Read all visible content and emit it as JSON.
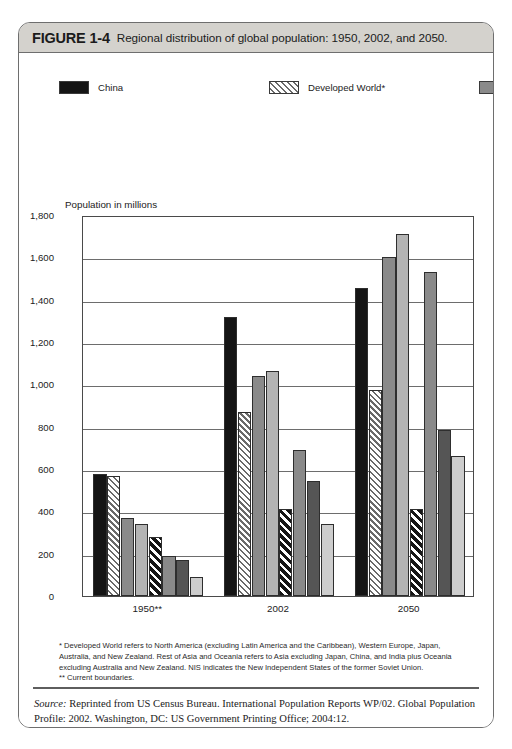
{
  "figure": {
    "label": "FIGURE 1-4",
    "title": "Regional distribution of global population: 1950, 2002, and 2050."
  },
  "legend": {
    "column_left": [
      {
        "label": "China",
        "swatch": "black-swatch",
        "fill": "#151515"
      },
      {
        "label": "Developed World*",
        "swatch": "white-diagonal-hatch-swatch",
        "fill": "#ffffff"
      },
      {
        "label": "India",
        "swatch": "medium-gray-swatch",
        "fill": "#8a8a8a"
      },
      {
        "label": "Rest of Asia and Oceania*",
        "swatch": "light-gray-swatch",
        "fill": "#b4b4b4"
      }
    ],
    "column_right": [
      {
        "label": "Eastern Europe and the NIS*",
        "swatch": "black-diagonal-stripe-swatch",
        "fill": "#161616"
      },
      {
        "label": "Sub-Saharan Africa",
        "swatch": "medium-gray-swatch",
        "fill": "#8a8a8a"
      },
      {
        "label": "Latin America and the Caribbean",
        "swatch": "dark-gray-swatch",
        "fill": "#555555"
      },
      {
        "label": "Near East and North Africa",
        "swatch": "very-light-gray-swatch",
        "fill": "#cdcdcd"
      }
    ]
  },
  "footnote": {
    "line1": "* Developed World refers to North America (excluding Latin America and the Caribbean), Western Europe, Japan, Australia, and New Zealand.  Rest of Asia and Oceania refers to Asia excluding Japan, China, and India plus Oceania excluding Australia and New Zealand.  NIS indicates the New Independent States of the former Soviet Union.",
    "line2": "** Current boundaries."
  },
  "source": {
    "label": "Source:",
    "text": " Reprinted from US Census Bureau. International Population Reports WP/02. Global Population Profile: 2002. Washington, DC: US Government Printing Office; 2004:12."
  },
  "chart_data": {
    "type": "bar",
    "title": "Regional distribution of global population: 1950, 2002, and 2050.",
    "xlabel": "",
    "ylabel": "Population in millions",
    "ylim": [
      0,
      1800
    ],
    "yticks": [
      0,
      200,
      400,
      600,
      800,
      1000,
      1200,
      1400,
      1600,
      1800
    ],
    "ytick_labels": [
      "0",
      "200",
      "400",
      "600",
      "800",
      "1,000",
      "1,200",
      "1,400",
      "1,600",
      "1,800"
    ],
    "grid": true,
    "legend_position": "above-plot",
    "categories": [
      "1950**",
      "2002",
      "2050"
    ],
    "series": [
      {
        "name": "China",
        "fill": "#151515",
        "pattern": "solid",
        "values": [
          575,
          1320,
          1455
        ]
      },
      {
        "name": "Developed World*",
        "fill": "#ffffff",
        "pattern": "diagonal-hatch-light",
        "values": [
          565,
          870,
          975
        ]
      },
      {
        "name": "India",
        "fill": "#8a8a8a",
        "pattern": "solid",
        "values": [
          370,
          1040,
          1600
        ]
      },
      {
        "name": "Rest of Asia and Oceania*",
        "fill": "#b4b4b4",
        "pattern": "solid",
        "values": [
          340,
          1065,
          1710
        ]
      },
      {
        "name": "Eastern Europe and the NIS*",
        "fill": "#161616",
        "pattern": "diagonal-stripe-dark",
        "values": [
          280,
          410,
          410
        ]
      },
      {
        "name": "Sub-Saharan Africa",
        "fill": "#8a8a8a",
        "pattern": "solid",
        "values": [
          190,
          690,
          1530
        ]
      },
      {
        "name": "Latin America and the Caribbean",
        "fill": "#555555",
        "pattern": "solid",
        "values": [
          168,
          545,
          785
        ]
      },
      {
        "name": "Near East and North Africa",
        "fill": "#cdcdcd",
        "pattern": "solid",
        "values": [
          90,
          340,
          660
        ]
      }
    ]
  }
}
